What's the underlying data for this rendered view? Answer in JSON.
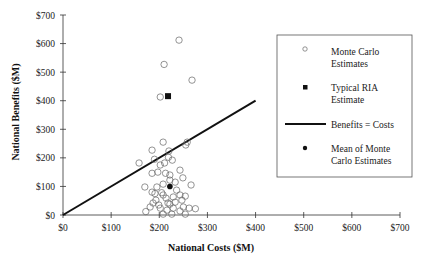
{
  "chart_data": {
    "type": "scatter",
    "title": "",
    "xlabel": "National Costs ($M)",
    "ylabel": "National Benefits ($M)",
    "xlim": [
      0,
      700
    ],
    "ylim": [
      0,
      700
    ],
    "x_ticks": [
      "$0",
      "$100",
      "$200",
      "$300",
      "$400",
      "$500",
      "$600",
      "$700"
    ],
    "y_ticks": [
      "$0",
      "$100",
      "$200",
      "$300",
      "$400",
      "$500",
      "$600",
      "$700"
    ],
    "grid": false,
    "legend_position": "right, inside plot",
    "series": [
      {
        "name": "Monte Carlo Estimates",
        "marker": "open-circle",
        "points": [
          [
            241,
            612
          ],
          [
            210,
            527
          ],
          [
            268,
            472
          ],
          [
            202,
            413
          ],
          [
            208,
            255
          ],
          [
            258,
            255
          ],
          [
            255,
            245
          ],
          [
            185,
            227
          ],
          [
            220,
            224
          ],
          [
            158,
            182
          ],
          [
            190,
            195
          ],
          [
            227,
            192
          ],
          [
            219,
            202
          ],
          [
            211,
            182
          ],
          [
            202,
            175
          ],
          [
            243,
            157
          ],
          [
            185,
            146
          ],
          [
            197,
            150
          ],
          [
            213,
            146
          ],
          [
            249,
            130
          ],
          [
            222,
            140
          ],
          [
            170,
            98
          ],
          [
            195,
            98
          ],
          [
            208,
            108
          ],
          [
            233,
            115
          ],
          [
            266,
            105
          ],
          [
            222,
            122
          ],
          [
            185,
            80
          ],
          [
            191,
            75
          ],
          [
            205,
            78
          ],
          [
            236,
            87
          ],
          [
            243,
            70
          ],
          [
            254,
            66
          ],
          [
            229,
            63
          ],
          [
            214,
            59
          ],
          [
            193,
            52
          ],
          [
            187,
            42
          ],
          [
            199,
            35
          ],
          [
            218,
            42
          ],
          [
            233,
            45
          ],
          [
            247,
            52
          ],
          [
            181,
            28
          ],
          [
            172,
            12
          ],
          [
            202,
            24
          ],
          [
            216,
            17
          ],
          [
            229,
            24
          ],
          [
            250,
            28
          ],
          [
            262,
            24
          ],
          [
            275,
            22
          ],
          [
            208,
            3
          ],
          [
            226,
            3
          ],
          [
            254,
            3
          ],
          [
            243,
            14
          ],
          [
            222,
            38
          ],
          [
            208,
            70
          ]
        ]
      },
      {
        "name": "Typical RIA Estimate",
        "marker": "filled-square",
        "points": [
          [
            214,
            416
          ]
        ]
      },
      {
        "name": "Benefits = Costs",
        "marker": "line",
        "points": [
          [
            0,
            0
          ],
          [
            400,
            400
          ]
        ]
      },
      {
        "name": "Mean of Monte Carlo Estimates",
        "marker": "filled-circle",
        "points": [
          [
            222,
            100
          ]
        ]
      }
    ]
  },
  "legend": {
    "items": [
      {
        "line1": "Monte Carlo",
        "line2": "Estimates"
      },
      {
        "line1": "Typical RIA",
        "line2": "Estimate"
      },
      {
        "line1": "Benefits = Costs",
        "line2": ""
      },
      {
        "line1": "Mean of Monte",
        "line2": "Carlo Estimates"
      }
    ]
  },
  "colors": {
    "ink": "#111111",
    "marker_stroke": "#555555",
    "background": "#ffffff"
  }
}
